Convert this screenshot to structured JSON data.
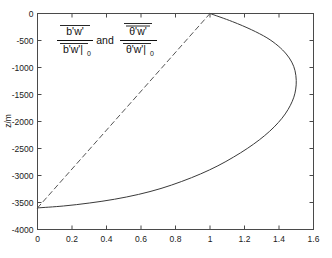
{
  "chart_data": {
    "type": "line",
    "title": "",
    "xlabel": "",
    "ylabel": "z/m",
    "xlim": [
      0,
      1.6
    ],
    "ylim": [
      -4000,
      0
    ],
    "grid": false,
    "legend": "none",
    "xticks": [
      "0",
      "0.2",
      "0.4",
      "0.6",
      "0.8",
      "1",
      "1.2",
      "1.4",
      "1.6"
    ],
    "xtick_values": [
      0,
      0.2,
      0.4,
      0.6,
      0.8,
      1,
      1.2,
      1.4,
      1.6
    ],
    "yticks": [
      "0",
      "-500",
      "-1000",
      "-1500",
      "-2000",
      "-2500",
      "-3000",
      "-3500",
      "-4000"
    ],
    "ytick_values": [
      0,
      -500,
      -1000,
      -1500,
      -2000,
      -2500,
      -3000,
      -3500,
      -4000
    ],
    "annotations": [
      {
        "name": "axis-formula-annotation",
        "numerator_1": "b'w'",
        "denominator_1": "b'w'|",
        "denominator_1_sub": "0",
        "conjunction": "and",
        "numerator_2": "θ'w'",
        "denominator_2": "θ'w'|",
        "denominator_2_sub": "0"
      }
    ],
    "series": [
      {
        "name": "buoyancy-flux-solid",
        "style": "solid",
        "color": "#3a3a3a",
        "points": [
          [
            1.0,
            0
          ],
          [
            1.13,
            -150
          ],
          [
            1.24,
            -300
          ],
          [
            1.33,
            -450
          ],
          [
            1.395,
            -600
          ],
          [
            1.442,
            -750
          ],
          [
            1.474,
            -900
          ],
          [
            1.493,
            -1060
          ],
          [
            1.5,
            -1240
          ],
          [
            1.497,
            -1400
          ],
          [
            1.486,
            -1550
          ],
          [
            1.466,
            -1700
          ],
          [
            1.436,
            -1860
          ],
          [
            1.396,
            -2020
          ],
          [
            1.346,
            -2180
          ],
          [
            1.286,
            -2340
          ],
          [
            1.216,
            -2500
          ],
          [
            1.136,
            -2660
          ],
          [
            1.046,
            -2820
          ],
          [
            0.946,
            -2970
          ],
          [
            0.836,
            -3110
          ],
          [
            0.716,
            -3240
          ],
          [
            0.586,
            -3350
          ],
          [
            0.446,
            -3440
          ],
          [
            0.3,
            -3510
          ],
          [
            0.15,
            -3565
          ],
          [
            0.0,
            -3600
          ]
        ]
      },
      {
        "name": "heat-flux-dashed",
        "style": "dashed",
        "color": "#555555",
        "points": [
          [
            1.0,
            0
          ],
          [
            0.0,
            -3600
          ]
        ]
      }
    ]
  },
  "axes": {
    "ylabel": "z/m"
  }
}
